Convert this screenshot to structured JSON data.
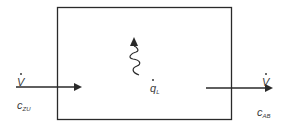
{
  "diagram": {
    "type": "control-volume-balance",
    "control_volume": {
      "label": ""
    },
    "inflow": {
      "flow_symbol": "V",
      "flow_dot": true,
      "conc_symbol": "c",
      "conc_subscript": "ZU"
    },
    "outflow": {
      "flow_symbol": "V",
      "flow_dot": true,
      "conc_symbol": "c",
      "conc_subscript": "AB"
    },
    "heat_loss": {
      "symbol": "q",
      "dot": true,
      "subscript": "L"
    },
    "colors": {
      "line": "#2a2a2a",
      "text": "#3a3a3a",
      "background": "#ffffff"
    }
  }
}
